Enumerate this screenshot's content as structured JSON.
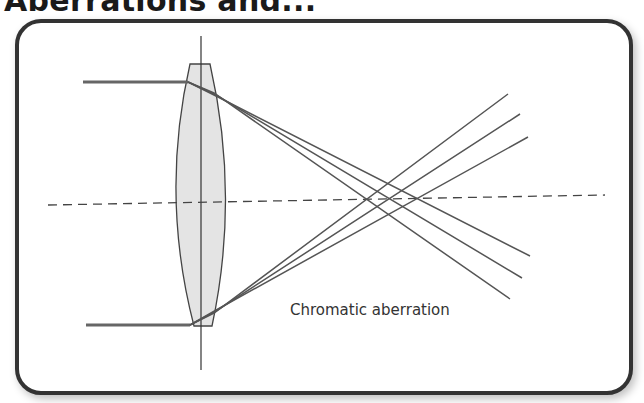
{
  "title": "Aberrations and...",
  "diagram": {
    "caption": "Chromatic aberration",
    "elements": [
      "lens",
      "optical-axis",
      "lens-plane",
      "incoming-rays",
      "refracted-rays"
    ],
    "colors": {
      "frame": "#333333",
      "lens_fill": "#e4e4e4",
      "ray": "#555555",
      "axis": "#444444"
    }
  }
}
